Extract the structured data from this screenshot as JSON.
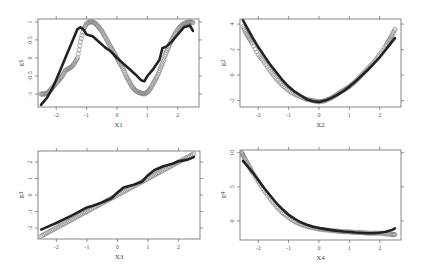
{
  "figure": {
    "layout": "2x2 grid of scatter plots with fitted smooth curves",
    "colors": {
      "points": "#8a8a8a",
      "fit_line": "#222222",
      "frame": "#666666",
      "background": "#ffffff"
    }
  },
  "chart_data": [
    {
      "type": "scatter",
      "panel": "top-left",
      "title": "",
      "xlabel": "X1",
      "ylabel": "g1",
      "xlim": [
        -2.6,
        2.7
      ],
      "ylim": [
        -1.36,
        1.08
      ],
      "xticks": [
        -2,
        -1,
        0,
        1,
        2
      ],
      "xtick_labels": [
        "-2",
        "-1",
        "0",
        "1",
        "2"
      ],
      "yticks": [
        -1,
        -0.5,
        0,
        0.5,
        1
      ],
      "ytick_labels": [
        "-1",
        "-0.5",
        "0",
        "0.5",
        "1"
      ],
      "grid": false,
      "frame": {
        "x": 38,
        "y": 19,
        "w": 161,
        "h": 88
      },
      "series": [
        {
          "name": "observed",
          "style": "open-circles",
          "x": [
            -2.5,
            -2.4,
            -2.3,
            -2.2,
            -2.1,
            -2.0,
            -1.9,
            -1.8,
            -1.7,
            -1.6,
            -1.5,
            -1.4,
            -1.3,
            -1.2,
            -1.1,
            -1.0,
            -0.9,
            -0.8,
            -0.7,
            -0.6,
            -0.5,
            -0.4,
            -0.3,
            -0.2,
            -0.1,
            0.0,
            0.1,
            0.2,
            0.3,
            0.4,
            0.5,
            0.6,
            0.7,
            0.8,
            0.9,
            1.0,
            1.1,
            1.2,
            1.3,
            1.4,
            1.5,
            1.6,
            1.7,
            1.8,
            1.9,
            2.0,
            2.1,
            2.2,
            2.3,
            2.4,
            2.5
          ],
          "y": [
            -1.0,
            -1.0,
            -0.98,
            -0.9,
            -0.8,
            -0.7,
            -0.6,
            -0.5,
            -0.35,
            -0.3,
            -0.25,
            -0.15,
            0.0,
            0.45,
            0.8,
            0.95,
            1.0,
            1.0,
            0.95,
            0.85,
            0.75,
            0.6,
            0.45,
            0.3,
            0.15,
            0.0,
            -0.15,
            -0.3,
            -0.5,
            -0.65,
            -0.8,
            -0.9,
            -0.95,
            -0.98,
            -1.0,
            -0.95,
            -0.85,
            -0.7,
            -0.55,
            -0.35,
            -0.15,
            0.1,
            0.3,
            0.5,
            0.65,
            0.78,
            0.88,
            0.95,
            0.98,
            1.0,
            0.98
          ]
        },
        {
          "name": "fitted",
          "style": "thick-line",
          "x": [
            -2.5,
            -2.3,
            -2.1,
            -1.9,
            -1.7,
            -1.5,
            -1.3,
            -1.2,
            -1.1,
            -1.0,
            -0.8,
            -0.6,
            -0.4,
            -0.2,
            0.0,
            0.2,
            0.4,
            0.6,
            0.8,
            0.9,
            1.0,
            1.2,
            1.4,
            1.5,
            1.6,
            1.8,
            2.0,
            2.2,
            2.4,
            2.5
          ],
          "y": [
            -1.3,
            -1.1,
            -0.8,
            -0.4,
            0.0,
            0.4,
            0.8,
            0.85,
            0.78,
            0.65,
            0.6,
            0.45,
            0.3,
            0.18,
            0.0,
            -0.15,
            -0.3,
            -0.45,
            -0.62,
            -0.65,
            -0.5,
            -0.3,
            -0.05,
            0.28,
            0.3,
            0.45,
            0.65,
            0.85,
            0.9,
            0.75
          ]
        }
      ]
    },
    {
      "type": "scatter",
      "panel": "top-right",
      "title": "",
      "xlabel": "X2",
      "ylabel": "g2",
      "xlim": [
        -2.6,
        2.7
      ],
      "ylim": [
        -2.5,
        4.4
      ],
      "xticks": [
        -2,
        -1,
        0,
        1,
        2
      ],
      "xtick_labels": [
        "-2",
        "-1",
        "0",
        "1",
        "2"
      ],
      "yticks": [
        -2,
        0,
        2,
        4
      ],
      "ytick_labels": [
        "-2",
        "0",
        "2",
        "4"
      ],
      "grid": false,
      "frame": {
        "x": 240,
        "y": 19,
        "w": 161,
        "h": 88
      },
      "series": [
        {
          "name": "observed",
          "style": "open-circles",
          "x": [
            -2.5,
            -2.4,
            -2.3,
            -2.2,
            -2.0,
            -1.8,
            -1.6,
            -1.4,
            -1.2,
            -1.0,
            -0.8,
            -0.6,
            -0.4,
            -0.2,
            0.0,
            0.2,
            0.4,
            0.6,
            0.8,
            1.0,
            1.2,
            1.4,
            1.6,
            1.8,
            2.0,
            2.2,
            2.3,
            2.4,
            2.5
          ],
          "y": [
            3.8,
            3.3,
            2.9,
            2.5,
            1.6,
            1.0,
            0.3,
            -0.3,
            -0.8,
            -1.2,
            -1.5,
            -1.7,
            -1.9,
            -2.0,
            -2.1,
            -2.0,
            -1.8,
            -1.5,
            -1.2,
            -0.9,
            -0.5,
            0.0,
            0.5,
            1.0,
            1.6,
            2.3,
            2.7,
            3.1,
            3.6
          ]
        },
        {
          "name": "fitted",
          "style": "thick-line",
          "x": [
            -2.5,
            -2.2,
            -2.0,
            -1.8,
            -1.6,
            -1.4,
            -1.2,
            -1.0,
            -0.8,
            -0.6,
            -0.4,
            -0.2,
            0.0,
            0.2,
            0.4,
            0.6,
            0.8,
            1.0,
            1.2,
            1.4,
            1.6,
            1.8,
            2.0,
            2.2,
            2.5
          ],
          "y": [
            4.3,
            3.0,
            2.2,
            1.5,
            0.8,
            0.2,
            -0.4,
            -0.9,
            -1.3,
            -1.6,
            -1.9,
            -2.05,
            -2.1,
            -2.0,
            -1.8,
            -1.55,
            -1.25,
            -0.9,
            -0.5,
            -0.05,
            0.4,
            0.9,
            1.4,
            2.0,
            2.9
          ]
        }
      ]
    },
    {
      "type": "scatter",
      "panel": "bottom-left",
      "title": "",
      "xlabel": "X3",
      "ylabel": "g3",
      "xlim": [
        -2.6,
        2.7
      ],
      "ylim": [
        -2.67,
        2.67
      ],
      "xticks": [
        -2,
        -1,
        0,
        1,
        2
      ],
      "xtick_labels": [
        "-2",
        "-1",
        "0",
        "1",
        "2"
      ],
      "yticks": [
        -2,
        -1,
        0,
        1,
        2
      ],
      "ytick_labels": [
        "-2",
        "-1",
        "0",
        "1",
        "2"
      ],
      "grid": false,
      "frame": {
        "x": 38,
        "y": 151,
        "w": 162,
        "h": 88
      },
      "series": [
        {
          "name": "observed",
          "style": "open-circles",
          "x": [
            -2.5,
            -2.3,
            -2.1,
            -1.9,
            -1.7,
            -1.5,
            -1.3,
            -1.1,
            -0.9,
            -0.7,
            -0.5,
            -0.3,
            -0.1,
            0.1,
            0.3,
            0.5,
            0.7,
            0.9,
            1.1,
            1.3,
            1.5,
            1.7,
            1.9,
            2.1,
            2.3,
            2.5
          ],
          "y": [
            -2.5,
            -2.3,
            -2.1,
            -1.9,
            -1.7,
            -1.5,
            -1.3,
            -1.1,
            -0.9,
            -0.7,
            -0.5,
            -0.3,
            -0.1,
            0.1,
            0.3,
            0.5,
            0.7,
            0.9,
            1.1,
            1.3,
            1.5,
            1.7,
            1.9,
            2.1,
            2.3,
            2.5
          ]
        },
        {
          "name": "fitted",
          "style": "thick-line",
          "x": [
            -2.5,
            -2.0,
            -1.5,
            -1.0,
            -0.8,
            -0.5,
            -0.2,
            0.0,
            0.2,
            0.5,
            0.8,
            1.0,
            1.2,
            1.5,
            1.8,
            2.0,
            2.3,
            2.5
          ],
          "y": [
            -2.1,
            -1.7,
            -1.25,
            -0.75,
            -0.65,
            -0.45,
            -0.2,
            0.15,
            0.45,
            0.6,
            0.8,
            1.2,
            1.5,
            1.75,
            1.9,
            2.05,
            2.15,
            2.3
          ]
        }
      ]
    },
    {
      "type": "scatter",
      "panel": "bottom-right",
      "title": "",
      "xlabel": "X4",
      "ylabel": "g4",
      "xlim": [
        -2.6,
        2.7
      ],
      "ylim": [
        -2.8,
        10.4
      ],
      "xticks": [
        -2,
        -1,
        0,
        1,
        2
      ],
      "xtick_labels": [
        "-2",
        "-1",
        "0",
        "1",
        "2"
      ],
      "yticks": [
        0,
        5,
        10
      ],
      "ytick_labels": [
        "0",
        "5",
        "10"
      ],
      "grid": false,
      "frame": {
        "x": 240,
        "y": 150,
        "w": 161,
        "h": 90
      },
      "series": [
        {
          "name": "observed",
          "style": "open-circles",
          "x": [
            -2.55,
            -2.5,
            -2.4,
            -2.3,
            -2.2,
            -2.0,
            -1.8,
            -1.6,
            -1.4,
            -1.2,
            -1.0,
            -0.8,
            -0.6,
            -0.4,
            -0.2,
            0.0,
            0.2,
            0.4,
            0.6,
            0.8,
            1.0,
            1.2,
            1.4,
            1.6,
            1.8,
            2.0,
            2.2,
            2.4,
            2.5
          ],
          "y": [
            10.0,
            9.6,
            8.8,
            8.0,
            7.2,
            5.8,
            4.4,
            3.2,
            2.1,
            1.2,
            0.5,
            -0.1,
            -0.5,
            -0.8,
            -1.0,
            -1.2,
            -1.3,
            -1.4,
            -1.5,
            -1.6,
            -1.6,
            -1.7,
            -1.7,
            -1.8,
            -1.8,
            -1.8,
            -1.9,
            -2.0,
            -2.0
          ]
        },
        {
          "name": "fitted",
          "style": "thick-line",
          "x": [
            -2.5,
            -2.2,
            -2.0,
            -1.8,
            -1.6,
            -1.4,
            -1.2,
            -1.0,
            -0.8,
            -0.6,
            -0.4,
            -0.2,
            0.0,
            0.4,
            0.8,
            1.2,
            1.6,
            1.8,
            2.0,
            2.2,
            2.4,
            2.5
          ],
          "y": [
            8.8,
            7.2,
            6.0,
            4.8,
            3.7,
            2.6,
            1.7,
            0.9,
            0.3,
            -0.2,
            -0.55,
            -0.85,
            -1.05,
            -1.35,
            -1.55,
            -1.7,
            -1.8,
            -1.8,
            -1.75,
            -1.6,
            -1.35,
            -1.1
          ]
        }
      ]
    }
  ]
}
